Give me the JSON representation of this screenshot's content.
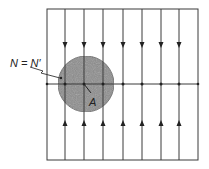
{
  "diagram": {
    "frame": {
      "x": 47,
      "y": 9,
      "width": 151,
      "height": 151
    },
    "vertical_lines_x": [
      65,
      84,
      103,
      123,
      142,
      161,
      179
    ],
    "horizontal_line_y": 84,
    "down_arrow_y": 45,
    "up_arrow_y": 123,
    "circle": {
      "cx": 86,
      "cy": 84,
      "r": 28,
      "fill": "#8a8a8a"
    },
    "line_color": "#3a3a3a",
    "labels": {
      "null_point": "N = N′",
      "area": "A"
    }
  }
}
